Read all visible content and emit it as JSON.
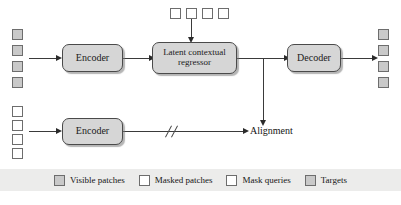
{
  "figure": {
    "type": "architecture-flow-diagram",
    "background_color": "#ffffff",
    "fill_gray": "#c9c9c9",
    "node_fill": "#d6d6d6",
    "stroke_color": "#3a3a3a",
    "legend_band_color": "#ececeb"
  },
  "nodes": {
    "encoder_top": "Encoder",
    "regressor_line1": "Latent contextual",
    "regressor_line2": "regressor",
    "decoder": "Decoder",
    "encoder_bottom": "Encoder",
    "alignment": "Alignment"
  },
  "patch_groups": {
    "input_visible": {
      "label": "Visible patches",
      "count": 4,
      "style": "filled"
    },
    "mask_queries_top": {
      "label": "Mask queries",
      "count": 4,
      "style": "empty"
    },
    "output_targets": {
      "label": "Targets",
      "count": 4,
      "style": "filled"
    },
    "input_masked": {
      "label": "Masked patches",
      "count": 4,
      "style": "empty"
    }
  },
  "edges": {
    "stop_gradient_marker": "//"
  },
  "legend": {
    "items": [
      {
        "label": "Visible patches",
        "style": "filled"
      },
      {
        "label": "Masked patches",
        "style": "empty"
      },
      {
        "label": "Mask queries",
        "style": "empty"
      },
      {
        "label": "Targets",
        "style": "filled"
      }
    ]
  }
}
